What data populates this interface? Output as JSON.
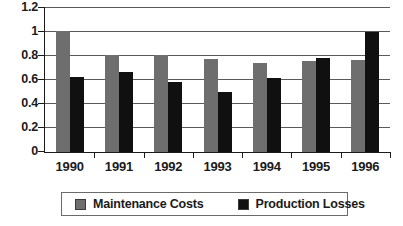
{
  "chart_data": {
    "type": "bar",
    "title": "",
    "xlabel": "",
    "ylabel": "",
    "categories": [
      "1990",
      "1991",
      "1992",
      "1993",
      "1994",
      "1995",
      "1996"
    ],
    "series": [
      {
        "name": "Maintenance Costs",
        "color": "#6e6e6e",
        "values": [
          1.0,
          0.8,
          0.8,
          0.77,
          0.74,
          0.75,
          0.76
        ]
      },
      {
        "name": "Production Losses",
        "color": "#101010",
        "values": [
          0.62,
          0.66,
          0.58,
          0.5,
          0.61,
          0.78,
          0.99
        ]
      }
    ],
    "ylim": [
      0,
      1.2
    ],
    "yticks": [
      0,
      0.2,
      0.4,
      0.6,
      0.8,
      1,
      1.2
    ],
    "ytick_labels": [
      "0",
      "0.2",
      "0.4",
      "0.6",
      "0.8",
      "1",
      "1.2"
    ],
    "grid": true,
    "legend_position": "bottom"
  }
}
